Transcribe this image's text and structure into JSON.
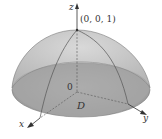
{
  "figure": {
    "labels": {
      "z_axis": "z",
      "x_axis": "x",
      "y_axis": "y",
      "apex": "(0, 0, 1)",
      "origin": "0",
      "region": "D"
    },
    "colors": {
      "surface_fill": "#b9b9b9",
      "surface_top": "#c8c8c8",
      "base_fill": "#a4a4a4",
      "edge": "#6e6e6e",
      "axis": "#3a3a3a",
      "background": "#ffffff"
    }
  }
}
